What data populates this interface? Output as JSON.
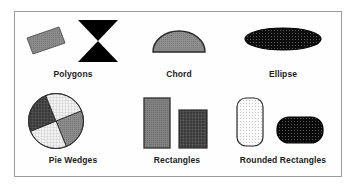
{
  "figure": {
    "title": "",
    "background_color": "#ffffff",
    "frame_color": "#9a9a9a",
    "frame_fill": "#fefefe"
  },
  "palette": {
    "black": "#000000",
    "outline": "#2b2b2b",
    "mid_gray": "#8a8a8a",
    "light_gray": "#d8d8d8",
    "dark_gray": "#4a4a4a",
    "near_white": "#f4f4f4",
    "label_color": "#1c1c1c"
  },
  "groups": [
    {
      "id": "polygons",
      "label": "Polygons",
      "shapes": [
        {
          "name": "rotated-rectangle-polygon",
          "kind": "polygon",
          "fill": "#8a8a8a",
          "stroke": "#4a4a4a",
          "pattern": "solid-gray",
          "rotation_deg": -20
        },
        {
          "name": "bowtie-polygon",
          "kind": "polygon",
          "fill": "#000000",
          "stroke": "#000000",
          "pattern": "solid-black",
          "rotation_deg": 0
        }
      ]
    },
    {
      "id": "chord",
      "label": "Chord",
      "shapes": [
        {
          "name": "semicircle-chord",
          "kind": "chord",
          "fill": "#8a8a8a",
          "stroke": "#2b2b2b",
          "pattern": "solid-gray",
          "start_angle_deg": 0,
          "sweep_deg": 180
        }
      ]
    },
    {
      "id": "ellipse",
      "label": "Ellipse",
      "shapes": [
        {
          "name": "flat-ellipse",
          "kind": "ellipse",
          "fill": "#1a1a1a",
          "stroke": "#000000",
          "pattern": "dot-grid-dark"
        }
      ]
    },
    {
      "id": "pie-wedges",
      "label": "Pie Wedges",
      "shapes": [
        {
          "name": "pie-wedge-1",
          "kind": "wedge",
          "fill": "#8a8a8a",
          "stroke": "#2b2b2b",
          "pattern": "solid-gray",
          "start_angle_deg": 22,
          "sweep_deg": 90
        },
        {
          "name": "pie-wedge-2",
          "kind": "wedge",
          "fill": "#ececec",
          "stroke": "#2b2b2b",
          "pattern": "fine-grid-light",
          "start_angle_deg": 112,
          "sweep_deg": 90
        },
        {
          "name": "pie-wedge-3",
          "kind": "wedge",
          "fill": "#3f3f3f",
          "stroke": "#2b2b2b",
          "pattern": "grid-dark",
          "start_angle_deg": 202,
          "sweep_deg": 90
        },
        {
          "name": "pie-wedge-4",
          "kind": "wedge",
          "fill": "#ececec",
          "stroke": "#2b2b2b",
          "pattern": "fine-grid-light",
          "start_angle_deg": 292,
          "sweep_deg": 90
        }
      ]
    },
    {
      "id": "rectangles",
      "label": "Rectangles",
      "shapes": [
        {
          "name": "tall-rectangle",
          "kind": "rect",
          "fill": "#7e7e7e",
          "stroke": "#3a3a3a",
          "pattern": "solid-gray",
          "width_px": 26,
          "height_px": 50
        },
        {
          "name": "short-rectangle",
          "kind": "rect",
          "fill": "#3f3f3f",
          "stroke": "#2b2b2b",
          "pattern": "grid-dark",
          "width_px": 28,
          "height_px": 38
        }
      ]
    },
    {
      "id": "rounded-rectangles",
      "label": "Rounded Rectangles",
      "shapes": [
        {
          "name": "tall-rounded-rectangle",
          "kind": "round-rect",
          "fill": "#fafafa",
          "stroke": "#2b2b2b",
          "pattern": "dot-grid-light",
          "width_px": 26,
          "height_px": 48,
          "corner_radius_px": 9
        },
        {
          "name": "wide-rounded-rectangle",
          "kind": "round-rect",
          "fill": "#111111",
          "stroke": "#000000",
          "pattern": "dot-grid-dark",
          "width_px": 46,
          "height_px": 26,
          "corner_radius_px": 12
        }
      ]
    }
  ]
}
